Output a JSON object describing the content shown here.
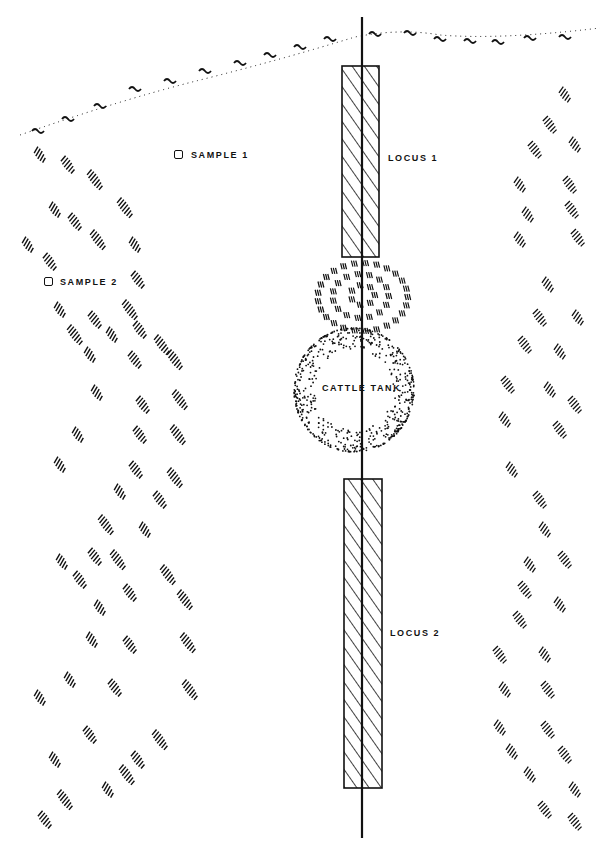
{
  "diagram": {
    "type": "archaeological site plan",
    "colors": {
      "ink": "#111111",
      "background": "#ffffff"
    },
    "labels": {
      "sample1": "SAMPLE 1",
      "sample2": "SAMPLE 2",
      "locus1": "LOCUS 1",
      "locus2": "LOCUS 2",
      "cattle_tank": "CATTLE TANK"
    },
    "features": {
      "shoreline": "dotted wavy line across top",
      "vertical_line": "central transect line",
      "locus1_rect": "hatched rectangle (upper)",
      "locus2_rect": "hatched rectangle (lower)",
      "mound_rings": "concentric hatch rings above tank",
      "cattle_tank": "stippled circle",
      "left_hatch_bands": "curved vegetation hatch bands, left",
      "right_hatch_bands": "curved vegetation hatch bands, right"
    }
  }
}
